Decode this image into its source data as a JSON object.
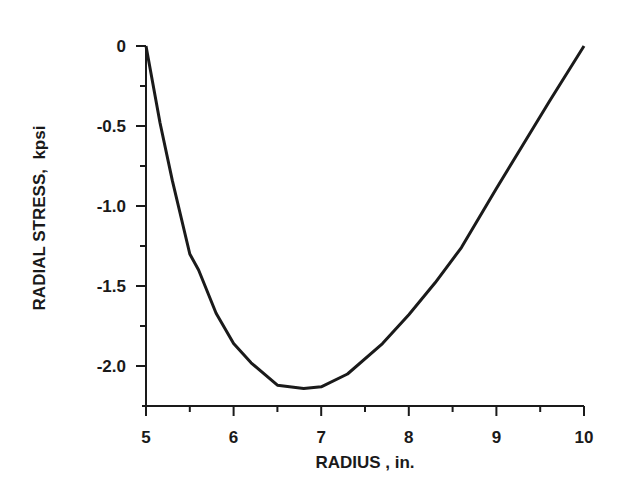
{
  "chart_data": {
    "type": "line",
    "title": "",
    "xlabel": "RADIUS , in.",
    "ylabel": "RADIAL STRESS,  kpsi",
    "xlim": [
      5,
      10
    ],
    "ylim": [
      -2.25,
      0
    ],
    "grid": false,
    "x_ticks": [
      5,
      6,
      7,
      8,
      9,
      10
    ],
    "x_tick_labels": [
      "5",
      "6",
      "7",
      "8",
      "9",
      "10"
    ],
    "x_minor_ticks": [
      5.5,
      6.5,
      7.5,
      8.5,
      9.5
    ],
    "y_ticks": [
      0,
      -0.5,
      -1.0,
      -1.5,
      -2.0
    ],
    "y_tick_labels": [
      "0",
      "-0.5",
      "-1.0",
      "-1.5",
      "-2.0"
    ],
    "y_minor_ticks": [
      -0.25,
      -0.75,
      -1.25,
      -1.75
    ],
    "series": [
      {
        "name": "radial stress",
        "color": "#1a1a1a",
        "x": [
          5.0,
          5.16,
          5.3,
          5.5,
          5.6,
          5.8,
          6.0,
          6.2,
          6.5,
          6.8,
          7.0,
          7.3,
          7.7,
          8.0,
          8.3,
          8.6,
          9.0,
          9.3,
          9.6,
          10.0
        ],
        "y": [
          0,
          -0.48,
          -0.84,
          -1.3,
          -1.4,
          -1.67,
          -1.86,
          -1.98,
          -2.12,
          -2.14,
          -2.13,
          -2.05,
          -1.86,
          -1.68,
          -1.48,
          -1.26,
          -0.89,
          -0.62,
          -0.35,
          0
        ]
      }
    ]
  }
}
